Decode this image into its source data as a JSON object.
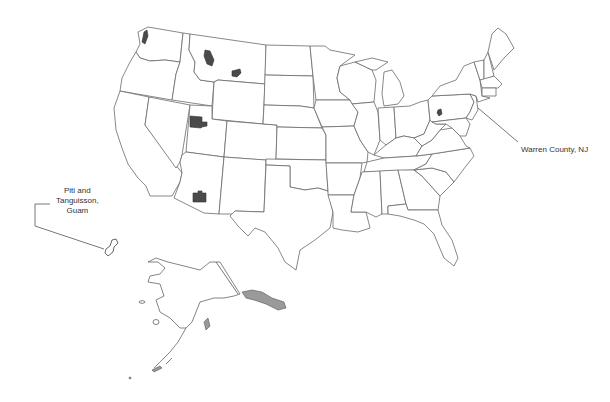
{
  "map": {
    "title": "",
    "region": "United States with Alaska inset and Guam callout",
    "colors": {
      "background": "#ffffff",
      "state_stroke": "#6a6a6a",
      "highlight_fill": "#4a4a4a",
      "label_text": "#333333"
    },
    "highlighted_sites": [
      {
        "id": "wa-site",
        "location": "northwestern Washington"
      },
      {
        "id": "mt-site-1",
        "location": "northwestern Montana"
      },
      {
        "id": "mt-site-2",
        "location": "central Montana"
      },
      {
        "id": "ut-site",
        "location": "northern Utah"
      },
      {
        "id": "az-site",
        "location": "southern Arizona"
      },
      {
        "id": "pa-site",
        "location": "western Pennsylvania"
      }
    ],
    "labels": {
      "guam": {
        "line1": "Piti and",
        "line2": "Tanguisson,",
        "line3": "Guam"
      },
      "nj": "Warren County, NJ"
    }
  }
}
